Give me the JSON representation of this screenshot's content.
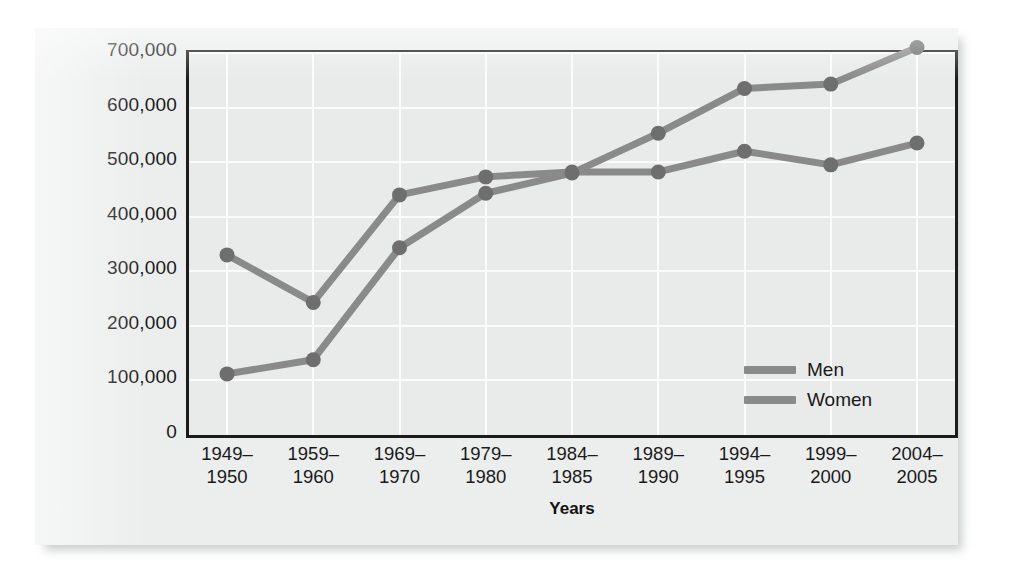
{
  "figure": {
    "background_color": "#eceded",
    "plot_background_color": "#e9eaea",
    "frame_color": "#1c1c1c",
    "gridline_color": "#fbfbfb"
  },
  "axes": {
    "y_title": "Degrees earned",
    "x_title": "Years",
    "y_ticks": [
      "0",
      "100,000",
      "200,000",
      "300,000",
      "400,000",
      "500,000",
      "600,000",
      "700,000"
    ],
    "x_ticks": [
      "1949–\n1950",
      "1959–\n1960",
      "1969–\n1970",
      "1979–\n1980",
      "1984–\n1985",
      "1989–\n1990",
      "1994–\n1995",
      "1999–\n2000",
      "2004–\n2005"
    ]
  },
  "legend": {
    "position": "inside-bottom-right",
    "entries": [
      {
        "label": "Men",
        "color": "#8a8a8a"
      },
      {
        "label": "Women",
        "color": "#8a8a8a"
      }
    ]
  },
  "chart_data": {
    "type": "line",
    "title": "",
    "subtitle": "",
    "xlabel": "Years",
    "ylabel": "Degrees earned",
    "ylim": [
      0,
      700000
    ],
    "ytick_step": 100000,
    "grid": true,
    "legend_position": "inside-bottom-right",
    "marker": "circle",
    "categories": [
      "1949–1950",
      "1959–1960",
      "1969–1970",
      "1979–1980",
      "1984–1985",
      "1989–1990",
      "1994–1995",
      "1999–2000",
      "2004–2005"
    ],
    "series": [
      {
        "name": "Men",
        "color": "#8a8a8a",
        "values": [
          330000,
          243000,
          440000,
          473000,
          482000,
          482000,
          520000,
          495000,
          535000
        ]
      },
      {
        "name": "Women",
        "color": "#8a8a8a",
        "values": [
          112000,
          138000,
          343000,
          443000,
          480000,
          553000,
          635000,
          643000,
          710000
        ]
      }
    ]
  }
}
